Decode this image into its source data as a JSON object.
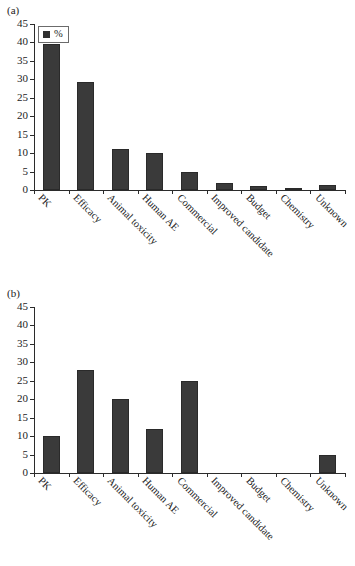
{
  "figure": {
    "panels": [
      {
        "id": "a",
        "panel_label": "(a)",
        "legend_label": "%",
        "legend_marker": "square-marker-icon"
      },
      {
        "id": "b",
        "panel_label": "(b)",
        "legend_label": "%",
        "legend_marker": "square-marker-icon"
      }
    ]
  },
  "chart_data": [
    {
      "type": "bar",
      "panel": "(a)",
      "title": "",
      "xlabel": "",
      "ylabel": "",
      "ylim": [
        0,
        45
      ],
      "yticks": [
        0,
        5,
        10,
        15,
        20,
        25,
        30,
        35,
        40,
        45
      ],
      "grid": false,
      "legend": [
        "%"
      ],
      "legend_position": "top-left",
      "bar_color": "#3a3a3a",
      "categories": [
        "PK",
        "Efficacy",
        "Animal toxicity",
        "Human AE",
        "Commercial",
        "Improved candidate",
        "Budget",
        "Chemistry",
        "Unknown"
      ],
      "values": [
        39.5,
        29.3,
        11.1,
        10.1,
        5.0,
        2.0,
        1.0,
        0.4,
        1.4
      ]
    },
    {
      "type": "bar",
      "panel": "(b)",
      "title": "",
      "xlabel": "",
      "ylabel": "",
      "ylim": [
        0,
        45
      ],
      "yticks": [
        0,
        5,
        10,
        15,
        20,
        25,
        30,
        35,
        40,
        45
      ],
      "grid": false,
      "legend": [
        "%"
      ],
      "legend_position": "top-left",
      "bar_color": "#3a3a3a",
      "categories": [
        "PK",
        "Efficacy",
        "Animal toxicity",
        "Human AE",
        "Commercial",
        "Improved candidate",
        "Budget",
        "Chemistry",
        "Unknown"
      ],
      "values": [
        10,
        28,
        20,
        12,
        25,
        0,
        0,
        0,
        5
      ]
    }
  ]
}
